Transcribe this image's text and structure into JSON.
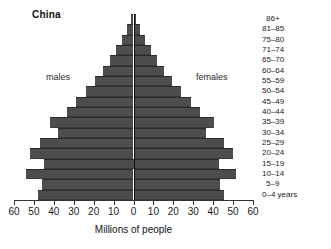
{
  "chart_data": {
    "type": "bar",
    "subtype": "population-pyramid",
    "title": "China",
    "xlabel": "Millions of people",
    "ylabel": "",
    "xlim": [
      -60,
      60
    ],
    "xticks": [
      60,
      50,
      40,
      30,
      20,
      10,
      0,
      10,
      20,
      30,
      40,
      50,
      60
    ],
    "grid": false,
    "legend_position": "inline",
    "bar_color": "#4d4d4d",
    "axis_color": "#333333",
    "categories": [
      "86+",
      "81–85",
      "75–80",
      "71–74",
      "65–70",
      "60–64",
      "55–59",
      "50–54",
      "45–49",
      "40–44",
      "35–39",
      "30–34",
      "25–29",
      "20–24",
      "15–19",
      "10–14",
      "5–9",
      "0–4 years"
    ],
    "series": [
      {
        "name": "males",
        "side": "left",
        "values": [
          1.5,
          3.5,
          6.0,
          9.0,
          12.0,
          15.5,
          19.5,
          24.0,
          29.0,
          33.5,
          42.0,
          38.0,
          47.0,
          52.0,
          45.0,
          54.0,
          46.0,
          48.0
        ]
      },
      {
        "name": "females",
        "side": "right",
        "values": [
          1.5,
          3.5,
          6.0,
          9.0,
          12.0,
          15.5,
          19.5,
          24.0,
          29.0,
          33.5,
          40.5,
          36.5,
          45.5,
          50.0,
          43.0,
          51.5,
          43.5,
          45.5
        ]
      }
    ]
  },
  "annotations": {
    "males_label": "males",
    "females_label": "females"
  }
}
